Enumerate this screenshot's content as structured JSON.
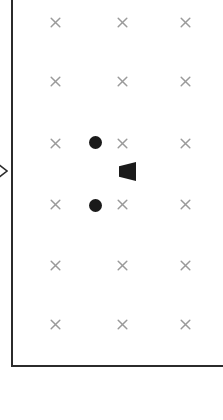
{
  "diagram": {
    "canvas": {
      "width": 223,
      "height": 420,
      "background": "#ffffff"
    },
    "frame": {
      "name": "L-shaped boundary",
      "stroke_color": "#2b2b2b",
      "stroke_width": 2,
      "left_rule": {
        "x": 11,
        "y": 0,
        "height": 367
      },
      "bottom_rule": {
        "x": 11,
        "y": 365,
        "width": 212
      }
    },
    "grid": {
      "marker_glyph": "×",
      "marker_name": "x-marker",
      "marker_color": "#9a9a9a",
      "marker_size": 13,
      "columns_x": [
        55,
        122,
        185
      ],
      "rows_y": [
        22,
        81,
        143,
        204,
        265,
        324
      ],
      "column_count": 3,
      "row_count": 6,
      "total_markers": 18
    },
    "markers": [
      {
        "id": "x-r1-c1",
        "x": 55,
        "y": 22
      },
      {
        "id": "x-r1-c2",
        "x": 122,
        "y": 22
      },
      {
        "id": "x-r1-c3",
        "x": 185,
        "y": 22
      },
      {
        "id": "x-r2-c1",
        "x": 55,
        "y": 81
      },
      {
        "id": "x-r2-c2",
        "x": 122,
        "y": 81
      },
      {
        "id": "x-r2-c3",
        "x": 185,
        "y": 81
      },
      {
        "id": "x-r3-c1",
        "x": 55,
        "y": 143
      },
      {
        "id": "x-r3-c2",
        "x": 122,
        "y": 143
      },
      {
        "id": "x-r3-c3",
        "x": 185,
        "y": 143
      },
      {
        "id": "x-r4-c1",
        "x": 55,
        "y": 204
      },
      {
        "id": "x-r4-c2",
        "x": 122,
        "y": 204
      },
      {
        "id": "x-r4-c3",
        "x": 185,
        "y": 204
      },
      {
        "id": "x-r5-c1",
        "x": 55,
        "y": 265
      },
      {
        "id": "x-r5-c2",
        "x": 122,
        "y": 265
      },
      {
        "id": "x-r5-c3",
        "x": 185,
        "y": 265
      },
      {
        "id": "x-r6-c1",
        "x": 55,
        "y": 324
      },
      {
        "id": "x-r6-c2",
        "x": 122,
        "y": 324
      },
      {
        "id": "x-r6-c3",
        "x": 185,
        "y": 324
      }
    ],
    "objects": [
      {
        "id": "filled-circle-upper",
        "shape": "circle",
        "cx": 95,
        "cy": 142,
        "diameter": 13,
        "fill": "#1a1a1a"
      },
      {
        "id": "filled-circle-lower",
        "shape": "circle",
        "cx": 95,
        "cy": 205,
        "diameter": 13,
        "fill": "#1a1a1a"
      },
      {
        "id": "wedge-pointer",
        "shape": "trapezoid",
        "direction": "left",
        "x": 119,
        "y": 162,
        "width": 17,
        "height": 19,
        "fill": "#1a1a1a"
      },
      {
        "id": "edge-chevron",
        "shape": "chevron",
        "direction": "right",
        "x": -4,
        "y": 162,
        "width": 12,
        "height": 18,
        "stroke": "#2b2b2b",
        "clipped": true
      }
    ]
  }
}
